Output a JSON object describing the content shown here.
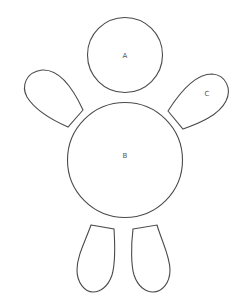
{
  "diagram": {
    "stroke_color": "#4a4a4a",
    "background": "#ffffff",
    "parts": [
      {
        "id": "head",
        "shape": "circle",
        "label": "A"
      },
      {
        "id": "body",
        "shape": "circle",
        "label": "B"
      },
      {
        "id": "left-arm",
        "shape": "rounded-paddle",
        "label": ""
      },
      {
        "id": "right-arm",
        "shape": "rounded-paddle",
        "label": "C"
      },
      {
        "id": "left-leg",
        "shape": "rounded-paddle",
        "label": ""
      },
      {
        "id": "right-leg",
        "shape": "rounded-paddle",
        "label": ""
      }
    ]
  }
}
